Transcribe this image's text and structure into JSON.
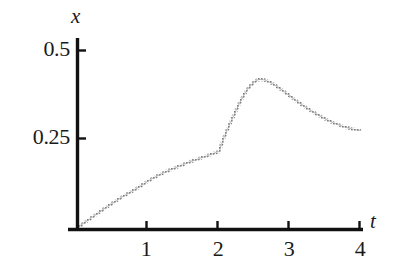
{
  "figure": {
    "background_color": "#ffffff",
    "axis_color": "#111111",
    "curve_color": "#8e8e8e"
  },
  "axes": {
    "y_title": "x",
    "x_title": "t",
    "y_ticks": [
      {
        "label": "0.5",
        "value": 0.5
      },
      {
        "label": "0.25",
        "value": 0.25
      }
    ],
    "x_ticks": [
      {
        "label": "1",
        "value": 1
      },
      {
        "label": "2",
        "value": 2
      },
      {
        "label": "3",
        "value": 3
      },
      {
        "label": "4",
        "value": 4
      }
    ]
  },
  "chart_data": {
    "type": "line",
    "title": "",
    "xlabel": "t",
    "ylabel": "x",
    "xlim": [
      0,
      4
    ],
    "ylim": [
      0,
      0.56
    ],
    "grid": false,
    "legend": null,
    "annotations": [
      {
        "text": "kink at t = 2",
        "x": 2,
        "y": 0.215
      },
      {
        "text": "peak near t = 2.55",
        "x": 2.55,
        "y": 0.418
      }
    ],
    "series": [
      {
        "name": "x(t)",
        "style": "dotted-line",
        "color": "#8e8e8e",
        "x": [
          0.0,
          0.1,
          0.2,
          0.3,
          0.4,
          0.5,
          0.6,
          0.7,
          0.8,
          0.9,
          1.0,
          1.1,
          1.2,
          1.3,
          1.4,
          1.5,
          1.6,
          1.7,
          1.8,
          1.9,
          1.95,
          2.0,
          2.03,
          2.06,
          2.1,
          2.15,
          2.2,
          2.25,
          2.3,
          2.35,
          2.4,
          2.45,
          2.5,
          2.55,
          2.6,
          2.65,
          2.7,
          2.75,
          2.8,
          2.85,
          2.9,
          3.0,
          3.1,
          3.2,
          3.3,
          3.4,
          3.5,
          3.6,
          3.7,
          3.8,
          3.9,
          4.0
        ],
        "y": [
          0.0,
          0.014,
          0.028,
          0.042,
          0.056,
          0.069,
          0.082,
          0.094,
          0.105,
          0.118,
          0.131,
          0.142,
          0.152,
          0.161,
          0.169,
          0.177,
          0.185,
          0.192,
          0.199,
          0.206,
          0.21,
          0.213,
          0.232,
          0.249,
          0.268,
          0.291,
          0.312,
          0.334,
          0.355,
          0.373,
          0.389,
          0.401,
          0.411,
          0.417,
          0.418,
          0.416,
          0.412,
          0.407,
          0.401,
          0.394,
          0.387,
          0.372,
          0.357,
          0.343,
          0.33,
          0.318,
          0.307,
          0.297,
          0.289,
          0.282,
          0.277,
          0.273
        ]
      }
    ]
  }
}
